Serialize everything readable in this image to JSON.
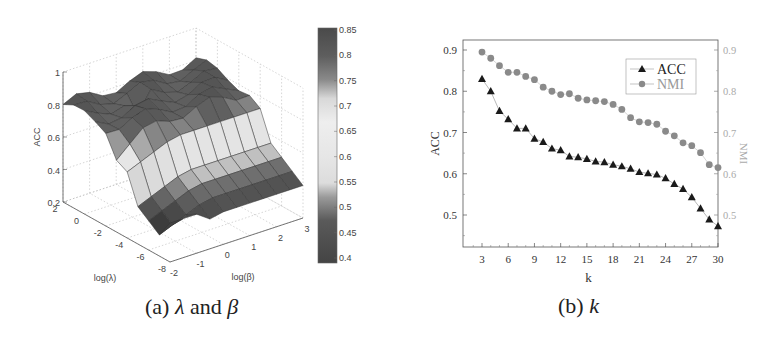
{
  "chart_data": [
    {
      "type": "surface3d",
      "panel": "a",
      "caption": {
        "prefix": "(a) ",
        "sym1": "λ",
        "mid": " and ",
        "sym2": "β"
      },
      "zlabel": "ACC",
      "xlabel": "log(λ)",
      "ylabel": "log(β)",
      "z_ticks": [
        "1",
        "0.8",
        "0.6",
        "0.4",
        "0.2"
      ],
      "lambda_ticks": [
        "2",
        "0",
        "-2",
        "-4",
        "-6",
        "-8"
      ],
      "beta_ticks": [
        "-2",
        "-1",
        "0",
        "1",
        "2",
        "3"
      ],
      "zlim": [
        0.2,
        1
      ],
      "colorbar": {
        "ticks": [
          "0.85",
          "0.8",
          "0.75",
          "0.7",
          "0.65",
          "0.6",
          "0.55",
          "0.5",
          "0.45",
          "0.4"
        ],
        "range": [
          0.4,
          0.85
        ]
      },
      "description": "Surface of ACC over log(lambda) in [-8,2] and log(beta) in [-2,3]; plateau around 0.75-0.85 for larger lambda, dropping to ~0.4-0.45 for small lambda."
    },
    {
      "type": "line",
      "panel": "b",
      "caption": {
        "prefix": "(b) ",
        "sym": "k"
      },
      "xlabel": "k",
      "ylabel": "ACC",
      "ylabel_right": "NMI",
      "x_ticks": [
        "3",
        "6",
        "9",
        "12",
        "15",
        "18",
        "21",
        "24",
        "27",
        "30"
      ],
      "y_ticks": [
        "0.9",
        "0.8",
        "0.7",
        "0.6",
        "0.5"
      ],
      "y_ticks_right": [
        "0.9",
        "0.8",
        "0.7",
        "0.6",
        "0.5"
      ],
      "xlim": [
        1,
        30
      ],
      "ylim": [
        0.425,
        0.925
      ],
      "legend": {
        "position": "upper right",
        "entries": [
          "ACC",
          "NMI"
        ]
      },
      "x": [
        3,
        4,
        5,
        6,
        7,
        8,
        9,
        10,
        11,
        12,
        13,
        14,
        15,
        16,
        17,
        18,
        19,
        20,
        21,
        22,
        23,
        24,
        25,
        26,
        27,
        28,
        29,
        30
      ],
      "series": [
        {
          "name": "ACC",
          "marker": "triangle",
          "color": "#1a1a1a",
          "values": [
            0.83,
            0.8,
            0.752,
            0.732,
            0.71,
            0.71,
            0.685,
            0.677,
            0.661,
            0.657,
            0.642,
            0.64,
            0.636,
            0.63,
            0.628,
            0.622,
            0.618,
            0.612,
            0.604,
            0.601,
            0.598,
            0.589,
            0.575,
            0.563,
            0.543,
            0.516,
            0.489,
            0.473
          ]
        },
        {
          "name": "NMI",
          "marker": "circle",
          "color": "#8a8a8a",
          "values": [
            0.895,
            0.88,
            0.862,
            0.846,
            0.846,
            0.836,
            0.828,
            0.81,
            0.8,
            0.792,
            0.794,
            0.783,
            0.779,
            0.777,
            0.775,
            0.768,
            0.756,
            0.736,
            0.726,
            0.724,
            0.72,
            0.703,
            0.692,
            0.675,
            0.668,
            0.651,
            0.622,
            0.615
          ]
        }
      ]
    }
  ]
}
